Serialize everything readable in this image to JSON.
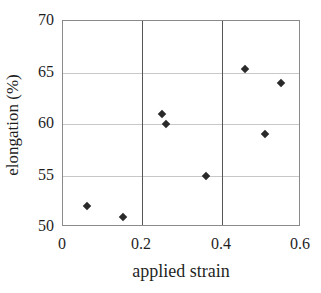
{
  "chart_data": {
    "type": "scatter",
    "title": "",
    "xlabel": "applied strain",
    "ylabel": "elongation (%)",
    "xlim": [
      0,
      0.6
    ],
    "ylim": [
      50,
      70
    ],
    "x_ticks": [
      0,
      0.2,
      0.4,
      0.6
    ],
    "x_tick_labels": [
      "0",
      "0.2",
      "0.4",
      "0.6"
    ],
    "y_ticks": [
      50,
      55,
      60,
      65,
      70
    ],
    "y_tick_labels": [
      "50",
      "55",
      "60",
      "65",
      "70"
    ],
    "h_gridlines": [
      55,
      60,
      65
    ],
    "v_lines": [
      0.2,
      0.4
    ],
    "grid": "horizontal-light",
    "legend": "none",
    "marker": "diamond",
    "points": [
      {
        "x": 0.06,
        "y": 52
      },
      {
        "x": 0.15,
        "y": 51
      },
      {
        "x": 0.25,
        "y": 61
      },
      {
        "x": 0.26,
        "y": 60
      },
      {
        "x": 0.36,
        "y": 55
      },
      {
        "x": 0.46,
        "y": 65.3
      },
      {
        "x": 0.51,
        "y": 59
      },
      {
        "x": 0.55,
        "y": 64
      }
    ],
    "colors": {
      "background": "#ffffff",
      "frame": "#8a8a8a",
      "gridline": "#c8c8c8",
      "vline": "#555555",
      "marker": "#2a2a2a",
      "text": "#1f1f1f"
    }
  }
}
